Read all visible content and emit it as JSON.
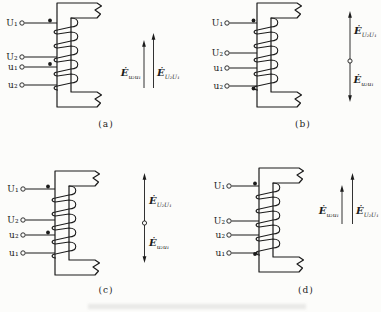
{
  "figure": {
    "background": "#fcfcfa",
    "ink": "#1b1b1b",
    "description_type": "transformer-winding-polarity-diagrams",
    "panels": [
      {
        "caption": "(a)",
        "terminals": [
          {
            "label": "U₁",
            "polarity_dot": true
          },
          {
            "label": "U₂",
            "polarity_dot": false
          },
          {
            "label": "u₁",
            "polarity_dot": true
          },
          {
            "label": "u₂",
            "polarity_dot": false
          }
        ],
        "emf": {
          "arrangement": "two-parallel-arrows-up",
          "left": {
            "base": "Ė",
            "sub": "u₂u₁"
          },
          "right": {
            "base": "Ė",
            "sub": "U₂U₁"
          }
        }
      },
      {
        "caption": "(b)",
        "terminals": [
          {
            "label": "U₁",
            "polarity_dot": true
          },
          {
            "label": "U₂",
            "polarity_dot": false
          },
          {
            "label": "u₁",
            "polarity_dot": false
          },
          {
            "label": "u₂",
            "polarity_dot": true
          }
        ],
        "emf": {
          "arrangement": "opposing-arrows-one-line",
          "top": {
            "base": "Ė",
            "sub": "U₂U₁"
          },
          "bottom": {
            "base": "Ė",
            "sub": "u₂u₁"
          }
        }
      },
      {
        "caption": "(c)",
        "terminals": [
          {
            "label": "U₁",
            "polarity_dot": true
          },
          {
            "label": "U₂",
            "polarity_dot": false
          },
          {
            "label": "u₂",
            "polarity_dot": true
          },
          {
            "label": "u₁",
            "polarity_dot": false
          }
        ],
        "emf": {
          "arrangement": "opposing-arrows-one-line",
          "top": {
            "base": "Ė",
            "sub": "U₂U₁"
          },
          "bottom": {
            "base": "Ė",
            "sub": "u₂u₁"
          }
        }
      },
      {
        "caption": "(d)",
        "terminals": [
          {
            "label": "U₁",
            "polarity_dot": true
          },
          {
            "label": "U₂",
            "polarity_dot": false
          },
          {
            "label": "u₂",
            "polarity_dot": false
          },
          {
            "label": "u₁",
            "polarity_dot": true
          }
        ],
        "emf": {
          "arrangement": "two-parallel-arrows-up",
          "left": {
            "base": "Ė",
            "sub": "u₂u₁"
          },
          "right": {
            "base": "Ė",
            "sub": "U₂U₁"
          }
        }
      }
    ]
  }
}
